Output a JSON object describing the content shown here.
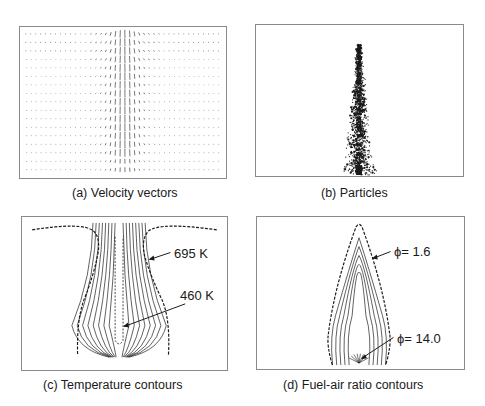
{
  "figure": {
    "panels": [
      {
        "id": "a",
        "caption": "(a) Velocity vectors"
      },
      {
        "id": "b",
        "caption": "(b) Particles"
      },
      {
        "id": "c",
        "caption": "(c) Temperature contours",
        "annotations": [
          "695 K",
          "460 K"
        ]
      },
      {
        "id": "d",
        "caption": "(d) Fuel-air ratio contours",
        "annotations": [
          "ϕ= 1.6",
          "ϕ= 14.0"
        ]
      }
    ]
  },
  "colors": {
    "ink": "#1a1a1a",
    "frame": "#8a8a8a",
    "background": "#ffffff"
  }
}
